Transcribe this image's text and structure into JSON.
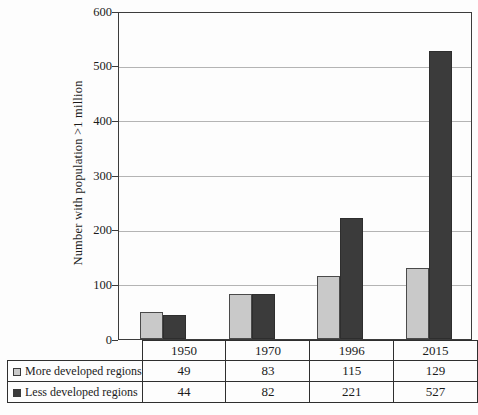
{
  "chart_data": {
    "type": "bar",
    "title": "",
    "ylabel": "Number with population >1 million",
    "xlabel": "",
    "categories": [
      "1950",
      "1970",
      "1996",
      "2015"
    ],
    "series": [
      {
        "name": "More developed regions",
        "color": "#c9c9c9",
        "border_color": "#4a4a4a",
        "values": [
          49,
          83,
          115,
          129
        ]
      },
      {
        "name": "Less developed regions",
        "color": "#3b3b3b",
        "border_color": "#2e2e2e",
        "values": [
          44,
          82,
          221,
          527
        ]
      }
    ],
    "ylim": [
      0,
      600
    ],
    "ytick_step": 100,
    "yticks": [
      0,
      100,
      200,
      300,
      400,
      500,
      600
    ],
    "grid": true,
    "legend_position": "table-left"
  },
  "colors": {
    "axis": "#3c3c3c",
    "gridline": "#b4b4b4",
    "table_border": "#2f2f2f",
    "background": "#fdfdfd",
    "text": "#1b1b1b"
  }
}
